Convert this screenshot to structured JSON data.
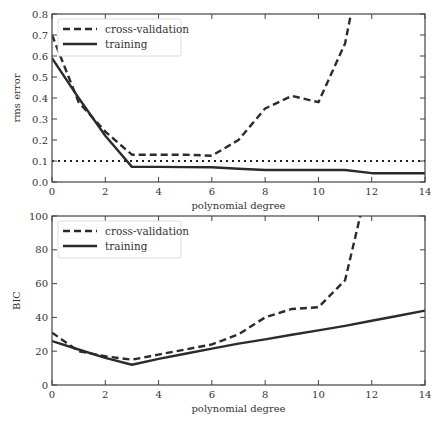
{
  "chart_data": [
    {
      "type": "line",
      "title": "",
      "xlabel": "polynomial degree",
      "ylabel": "rms error",
      "xlim": [
        0,
        14
      ],
      "ylim": [
        0,
        0.8
      ],
      "xticks": [
        0,
        2,
        4,
        6,
        8,
        10,
        12,
        14
      ],
      "yticks": [
        0.0,
        0.1,
        0.2,
        0.3,
        0.4,
        0.5,
        0.6,
        0.7,
        0.8
      ],
      "ytick_labels": [
        "0.0",
        "0.1",
        "0.2",
        "0.3",
        "0.4",
        "0.5",
        "0.6",
        "0.7",
        "0.8"
      ],
      "grid": false,
      "legend_position": "upper left",
      "series": [
        {
          "name": "cross-validation",
          "style": "dashed",
          "x": [
            0,
            1,
            2,
            3,
            4,
            5,
            6,
            7,
            8,
            9,
            10,
            11,
            11.3
          ],
          "y": [
            0.7,
            0.38,
            0.24,
            0.13,
            0.13,
            0.13,
            0.125,
            0.2,
            0.35,
            0.41,
            0.38,
            0.66,
            0.85
          ]
        },
        {
          "name": "training",
          "style": "solid",
          "x": [
            0,
            1,
            2,
            3,
            4,
            5,
            6,
            7,
            8,
            9,
            10,
            11,
            12,
            13,
            14
          ],
          "y": [
            0.59,
            0.4,
            0.22,
            0.072,
            0.072,
            0.071,
            0.07,
            0.063,
            0.057,
            0.057,
            0.057,
            0.057,
            0.042,
            0.042,
            0.042
          ]
        }
      ],
      "reference_line": {
        "y": 0.1,
        "style": "dotted"
      }
    },
    {
      "type": "line",
      "title": "",
      "xlabel": "polynomial degree",
      "ylabel": "BIC",
      "xlim": [
        0,
        14
      ],
      "ylim": [
        0,
        100
      ],
      "xticks": [
        0,
        2,
        4,
        6,
        8,
        10,
        12,
        14
      ],
      "yticks": [
        0,
        20,
        40,
        60,
        80,
        100
      ],
      "ytick_labels": [
        "0",
        "20",
        "40",
        "60",
        "80",
        "100"
      ],
      "grid": false,
      "legend_position": "upper left",
      "series": [
        {
          "name": "cross-validation",
          "style": "dashed",
          "x": [
            0,
            1,
            2,
            3,
            4,
            5,
            6,
            7,
            8,
            9,
            10,
            11,
            11.6
          ],
          "y": [
            31,
            20,
            17,
            15,
            18,
            21,
            24,
            30,
            40,
            45,
            46,
            62,
            102
          ]
        },
        {
          "name": "training",
          "style": "solid",
          "x": [
            0,
            1,
            2,
            3,
            4,
            5,
            6,
            7,
            8,
            9,
            10,
            11,
            12,
            13,
            14
          ],
          "y": [
            26,
            21,
            16,
            12,
            15.5,
            18.5,
            21.5,
            24.5,
            27,
            29.7,
            32.3,
            35,
            38,
            41,
            44
          ]
        }
      ]
    }
  ]
}
